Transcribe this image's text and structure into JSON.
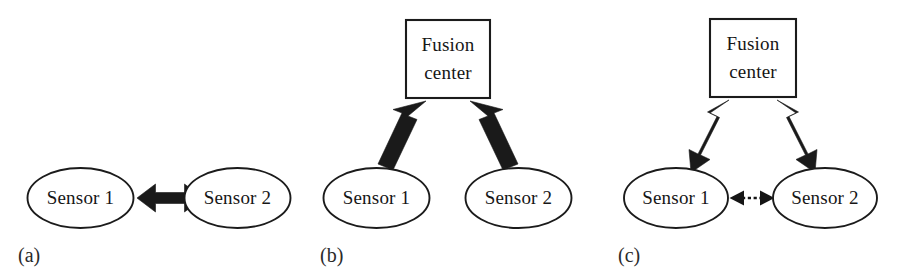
{
  "figure": {
    "background_color": "#ffffff",
    "ink_color": "#1a1a1a",
    "panels": [
      {
        "id": "a",
        "caption": "(a)",
        "topology": "decentralized-peer-to-peer",
        "nodes": [
          {
            "id": "a-sensor-1",
            "label": "Sensor 1",
            "shape": "ellipse"
          },
          {
            "id": "a-sensor-2",
            "label": "Sensor 2",
            "shape": "ellipse"
          }
        ],
        "links": [
          {
            "from": "a-sensor-1",
            "to": "a-sensor-2",
            "style": "thick-solid",
            "heads": "both"
          }
        ]
      },
      {
        "id": "b",
        "caption": "(b)",
        "topology": "centralized-fusion",
        "nodes": [
          {
            "id": "b-fusion-center",
            "label_line_1": "Fusion",
            "label_line_2": "center",
            "shape": "rectangle"
          },
          {
            "id": "b-sensor-1",
            "label": "Sensor 1",
            "shape": "ellipse"
          },
          {
            "id": "b-sensor-2",
            "label": "Sensor 2",
            "shape": "ellipse"
          }
        ],
        "links": [
          {
            "from": "b-sensor-1",
            "to": "b-fusion-center",
            "style": "thick-solid",
            "heads": "single"
          },
          {
            "from": "b-sensor-2",
            "to": "b-fusion-center",
            "style": "thick-solid",
            "heads": "single"
          }
        ]
      },
      {
        "id": "c",
        "caption": "(c)",
        "topology": "fusion-with-feedback-and-sensor-link",
        "nodes": [
          {
            "id": "c-fusion-center",
            "label_line_1": "Fusion",
            "label_line_2": "center",
            "shape": "rectangle"
          },
          {
            "id": "c-sensor-1",
            "label": "Sensor 1",
            "shape": "ellipse"
          },
          {
            "id": "c-sensor-2",
            "label": "Sensor 2",
            "shape": "ellipse"
          }
        ],
        "links": [
          {
            "from": "c-sensor-1",
            "to": "c-fusion-center",
            "style": "thick-solid",
            "heads": "both"
          },
          {
            "from": "c-sensor-2",
            "to": "c-fusion-center",
            "style": "thick-solid",
            "heads": "both"
          },
          {
            "from": "c-sensor-1",
            "to": "c-sensor-2",
            "style": "thin-dashed",
            "heads": "both"
          }
        ]
      }
    ]
  }
}
